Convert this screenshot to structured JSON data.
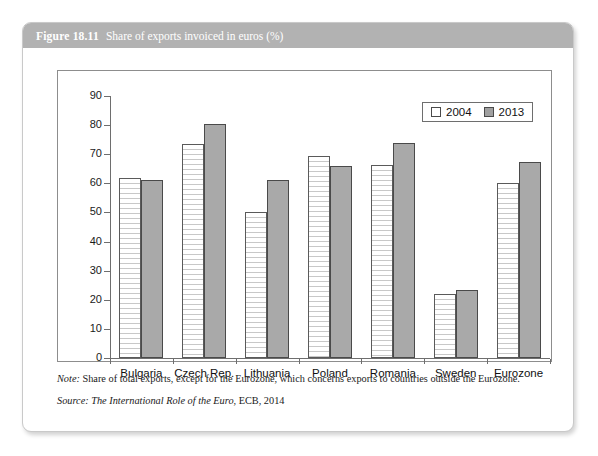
{
  "figure": {
    "number": "Figure 18.11",
    "title": "Share of exports invoiced in euros (%)",
    "note_label": "Note:",
    "note_text": "Share of total exports, except for the Eurozone, which concerns exports to countries outside the Eurozone.",
    "source_label": "Source:",
    "source_title": "The International Role of the Euro",
    "source_rest": ", ECB, 2014"
  },
  "colors": {
    "header_bar": "#b2b2b2",
    "series_2004": "#ffffff",
    "series_2013": "#a9a9a9",
    "axis": "#6e6e6e",
    "card_border": "#c9c9c9"
  },
  "chart_data": {
    "type": "bar",
    "title": "Share of exports invoiced in euros (%)",
    "xlabel": "",
    "ylabel": "",
    "ylim": [
      0,
      90
    ],
    "yticks": [
      0,
      10,
      20,
      30,
      40,
      50,
      60,
      70,
      80,
      90
    ],
    "ytick_labels": [
      "0",
      "10",
      "20",
      "30",
      "40",
      "50",
      "60",
      "70",
      "80",
      "90"
    ],
    "grid": false,
    "legend_position": "top-right",
    "categories": [
      "Bulgaria",
      "Czech Rep.",
      "Lithuania",
      "Poland",
      "Romania",
      "Sweden",
      "Eurozone"
    ],
    "series": [
      {
        "name": "2004",
        "values": [
          62.0,
          73.5,
          50.0,
          69.5,
          66.3,
          22.0,
          60.0
        ]
      },
      {
        "name": "2013",
        "values": [
          61.0,
          80.3,
          61.0,
          66.0,
          73.8,
          23.5,
          67.4
        ]
      }
    ]
  }
}
